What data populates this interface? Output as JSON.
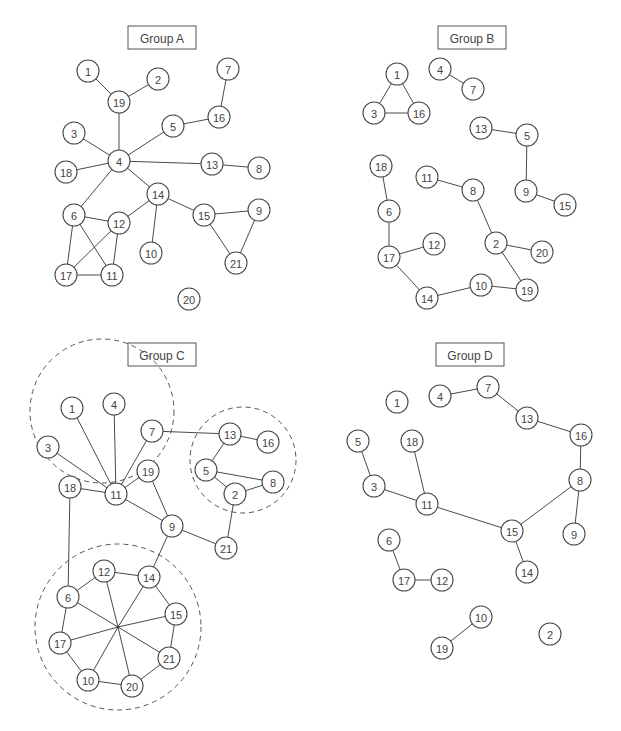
{
  "node_radius": 11,
  "groups": [
    {
      "id": "A",
      "title": "Group A",
      "title_box": {
        "x": 128,
        "y": 26,
        "w": 68,
        "h": 23
      },
      "clusters": [],
      "hubs": [],
      "nodes": [
        {
          "id": "1",
          "x": 88,
          "y": 71
        },
        {
          "id": "2",
          "x": 158,
          "y": 79
        },
        {
          "id": "19",
          "x": 119,
          "y": 102
        },
        {
          "id": "7",
          "x": 228,
          "y": 69
        },
        {
          "id": "16",
          "x": 219,
          "y": 117
        },
        {
          "id": "5",
          "x": 173,
          "y": 126
        },
        {
          "id": "3",
          "x": 74,
          "y": 133
        },
        {
          "id": "4",
          "x": 119,
          "y": 161
        },
        {
          "id": "18",
          "x": 66,
          "y": 172
        },
        {
          "id": "13",
          "x": 212,
          "y": 164
        },
        {
          "id": "8",
          "x": 259,
          "y": 168
        },
        {
          "id": "14",
          "x": 158,
          "y": 194
        },
        {
          "id": "6",
          "x": 74,
          "y": 215
        },
        {
          "id": "12",
          "x": 119,
          "y": 223
        },
        {
          "id": "15",
          "x": 204,
          "y": 215
        },
        {
          "id": "9",
          "x": 259,
          "y": 210
        },
        {
          "id": "10",
          "x": 151,
          "y": 253
        },
        {
          "id": "21",
          "x": 236,
          "y": 263
        },
        {
          "id": "17",
          "x": 66,
          "y": 275
        },
        {
          "id": "11",
          "x": 112,
          "y": 275
        },
        {
          "id": "20",
          "x": 189,
          "y": 299
        }
      ],
      "edges": [
        [
          "1",
          "19"
        ],
        [
          "2",
          "19"
        ],
        [
          "19",
          "4"
        ],
        [
          "7",
          "16"
        ],
        [
          "16",
          "5"
        ],
        [
          "5",
          "4"
        ],
        [
          "3",
          "4"
        ],
        [
          "18",
          "4"
        ],
        [
          "4",
          "13"
        ],
        [
          "13",
          "8"
        ],
        [
          "4",
          "14"
        ],
        [
          "4",
          "6"
        ],
        [
          "14",
          "12"
        ],
        [
          "14",
          "10"
        ],
        [
          "14",
          "15"
        ],
        [
          "15",
          "9"
        ],
        [
          "15",
          "21"
        ],
        [
          "9",
          "21"
        ],
        [
          "6",
          "12"
        ],
        [
          "6",
          "17"
        ],
        [
          "6",
          "11"
        ],
        [
          "12",
          "17"
        ],
        [
          "12",
          "11"
        ],
        [
          "17",
          "11"
        ]
      ]
    },
    {
      "id": "B",
      "title": "Group B",
      "title_box": {
        "x": 438,
        "y": 26,
        "w": 68,
        "h": 23
      },
      "clusters": [],
      "hubs": [],
      "nodes": [
        {
          "id": "1",
          "x": 397,
          "y": 74
        },
        {
          "id": "3",
          "x": 374,
          "y": 113
        },
        {
          "id": "16",
          "x": 419,
          "y": 113
        },
        {
          "id": "4",
          "x": 440,
          "y": 69
        },
        {
          "id": "7",
          "x": 473,
          "y": 89
        },
        {
          "id": "13",
          "x": 481,
          "y": 128
        },
        {
          "id": "5",
          "x": 527,
          "y": 135
        },
        {
          "id": "9",
          "x": 526,
          "y": 191
        },
        {
          "id": "15",
          "x": 565,
          "y": 205
        },
        {
          "id": "18",
          "x": 381,
          "y": 166
        },
        {
          "id": "11",
          "x": 427,
          "y": 177
        },
        {
          "id": "8",
          "x": 473,
          "y": 190
        },
        {
          "id": "6",
          "x": 389,
          "y": 211
        },
        {
          "id": "12",
          "x": 434,
          "y": 244
        },
        {
          "id": "17",
          "x": 389,
          "y": 257
        },
        {
          "id": "2",
          "x": 496,
          "y": 243
        },
        {
          "id": "20",
          "x": 542,
          "y": 252
        },
        {
          "id": "14",
          "x": 427,
          "y": 298
        },
        {
          "id": "10",
          "x": 481,
          "y": 285
        },
        {
          "id": "19",
          "x": 527,
          "y": 290
        }
      ],
      "edges": [
        [
          "1",
          "3"
        ],
        [
          "1",
          "16"
        ],
        [
          "3",
          "16"
        ],
        [
          "4",
          "7"
        ],
        [
          "13",
          "5"
        ],
        [
          "5",
          "9"
        ],
        [
          "9",
          "15"
        ],
        [
          "18",
          "6"
        ],
        [
          "6",
          "17"
        ],
        [
          "17",
          "12"
        ],
        [
          "17",
          "14"
        ],
        [
          "14",
          "10"
        ],
        [
          "10",
          "19"
        ],
        [
          "11",
          "8"
        ],
        [
          "8",
          "2"
        ],
        [
          "2",
          "20"
        ],
        [
          "2",
          "19"
        ]
      ]
    },
    {
      "id": "C",
      "title": "Group C",
      "title_box": {
        "x": 128,
        "y": 343,
        "w": 68,
        "h": 23
      },
      "clusters": [
        {
          "cx": 102,
          "cy": 411,
          "r": 72
        },
        {
          "cx": 243,
          "cy": 460,
          "r": 53
        },
        {
          "cx": 118,
          "cy": 627,
          "r": 83
        }
      ],
      "hubs": [
        {
          "id": "hub",
          "x": 118,
          "y": 627
        }
      ],
      "nodes": [
        {
          "id": "1",
          "x": 72,
          "y": 408
        },
        {
          "id": "4",
          "x": 114,
          "y": 404
        },
        {
          "id": "7",
          "x": 152,
          "y": 431
        },
        {
          "id": "3",
          "x": 48,
          "y": 447
        },
        {
          "id": "19",
          "x": 148,
          "y": 471
        },
        {
          "id": "18",
          "x": 70,
          "y": 487
        },
        {
          "id": "11",
          "x": 116,
          "y": 494
        },
        {
          "id": "13",
          "x": 230,
          "y": 434
        },
        {
          "id": "16",
          "x": 268,
          "y": 442
        },
        {
          "id": "5",
          "x": 206,
          "y": 470
        },
        {
          "id": "8",
          "x": 273,
          "y": 482
        },
        {
          "id": "2",
          "x": 235,
          "y": 494
        },
        {
          "id": "9",
          "x": 172,
          "y": 526
        },
        {
          "id": "21",
          "x": 226,
          "y": 548
        },
        {
          "id": "12",
          "x": 104,
          "y": 571
        },
        {
          "id": "14",
          "x": 149,
          "y": 577
        },
        {
          "id": "6",
          "x": 68,
          "y": 597
        },
        {
          "id": "15",
          "x": 176,
          "y": 614
        },
        {
          "id": "17",
          "x": 60,
          "y": 643
        },
        {
          "id": "21b",
          "label": "21",
          "x": 169,
          "y": 658
        },
        {
          "id": "10",
          "x": 88,
          "y": 680
        },
        {
          "id": "20",
          "x": 132,
          "y": 686
        }
      ],
      "edges": [
        [
          "1",
          "11"
        ],
        [
          "4",
          "11"
        ],
        [
          "7",
          "11"
        ],
        [
          "3",
          "11"
        ],
        [
          "18",
          "11"
        ],
        [
          "19",
          "11"
        ],
        [
          "11",
          "9"
        ],
        [
          "19",
          "9"
        ],
        [
          "7",
          "13"
        ],
        [
          "13",
          "16"
        ],
        [
          "13",
          "5"
        ],
        [
          "5",
          "8"
        ],
        [
          "5",
          "2"
        ],
        [
          "2",
          "8"
        ],
        [
          "2",
          "21"
        ],
        [
          "9",
          "21"
        ],
        [
          "9",
          "14"
        ],
        [
          "18",
          "6"
        ],
        [
          "6",
          "12"
        ],
        [
          "12",
          "14"
        ],
        [
          "14",
          "15"
        ],
        [
          "15",
          "21b"
        ],
        [
          "21b",
          "20"
        ],
        [
          "20",
          "10"
        ],
        [
          "10",
          "17"
        ],
        [
          "17",
          "6"
        ],
        [
          "hub",
          "6"
        ],
        [
          "hub",
          "12"
        ],
        [
          "hub",
          "14"
        ],
        [
          "hub",
          "15"
        ],
        [
          "hub",
          "21b"
        ],
        [
          "hub",
          "20"
        ],
        [
          "hub",
          "10"
        ],
        [
          "hub",
          "17"
        ]
      ]
    },
    {
      "id": "D",
      "title": "Group D",
      "title_box": {
        "x": 436,
        "y": 343,
        "w": 68,
        "h": 23
      },
      "clusters": [],
      "hubs": [],
      "nodes": [
        {
          "id": "1",
          "x": 397,
          "y": 402
        },
        {
          "id": "4",
          "x": 440,
          "y": 396
        },
        {
          "id": "7",
          "x": 488,
          "y": 387
        },
        {
          "id": "13",
          "x": 527,
          "y": 418
        },
        {
          "id": "16",
          "x": 581,
          "y": 435
        },
        {
          "id": "5",
          "x": 358,
          "y": 441
        },
        {
          "id": "18",
          "x": 412,
          "y": 441
        },
        {
          "id": "3",
          "x": 374,
          "y": 486
        },
        {
          "id": "8",
          "x": 580,
          "y": 480
        },
        {
          "id": "11",
          "x": 427,
          "y": 504
        },
        {
          "id": "15",
          "x": 512,
          "y": 531
        },
        {
          "id": "9",
          "x": 574,
          "y": 534
        },
        {
          "id": "6",
          "x": 389,
          "y": 540
        },
        {
          "id": "14",
          "x": 527,
          "y": 572
        },
        {
          "id": "17",
          "x": 404,
          "y": 580
        },
        {
          "id": "12",
          "x": 442,
          "y": 580
        },
        {
          "id": "10",
          "x": 481,
          "y": 617
        },
        {
          "id": "19",
          "x": 442,
          "y": 648
        },
        {
          "id": "2",
          "x": 550,
          "y": 634
        }
      ],
      "edges": [
        [
          "4",
          "7"
        ],
        [
          "7",
          "13"
        ],
        [
          "13",
          "16"
        ],
        [
          "16",
          "8"
        ],
        [
          "8",
          "15"
        ],
        [
          "8",
          "9"
        ],
        [
          "5",
          "3"
        ],
        [
          "3",
          "11"
        ],
        [
          "18",
          "11"
        ],
        [
          "11",
          "15"
        ],
        [
          "15",
          "14"
        ],
        [
          "6",
          "17"
        ],
        [
          "17",
          "12"
        ],
        [
          "10",
          "19"
        ]
      ]
    }
  ]
}
